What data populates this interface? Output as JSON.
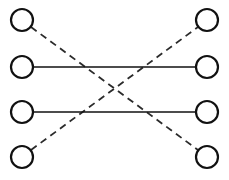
{
  "canvas": {
    "width": 229,
    "height": 180,
    "background_color": "#ffffff",
    "title": "Bipartite node diagram with solid and dashed connections"
  },
  "style": {
    "node_stroke_color": "#111111",
    "node_fill_color": "#ffffff",
    "node_stroke_width": 2.2,
    "node_radius": 11,
    "solid_edge_color": "#111111",
    "solid_edge_width": 1.6,
    "dashed_edge_color": "#2b2b2b",
    "dashed_edge_width": 1.8,
    "dash_pattern": "7 5"
  },
  "nodes": [
    {
      "id": "L1",
      "label": "",
      "side": "left",
      "row": 1,
      "cx": 22,
      "cy": 20,
      "r": 11
    },
    {
      "id": "L2",
      "label": "",
      "side": "left",
      "row": 2,
      "cx": 22,
      "cy": 67,
      "r": 11
    },
    {
      "id": "L3",
      "label": "",
      "side": "left",
      "row": 3,
      "cx": 22,
      "cy": 112,
      "r": 11
    },
    {
      "id": "L4",
      "label": "",
      "side": "left",
      "row": 4,
      "cx": 22,
      "cy": 157,
      "r": 11
    },
    {
      "id": "R1",
      "label": "",
      "side": "right",
      "row": 1,
      "cx": 207,
      "cy": 20,
      "r": 11
    },
    {
      "id": "R2",
      "label": "",
      "side": "right",
      "row": 2,
      "cx": 207,
      "cy": 67,
      "r": 11
    },
    {
      "id": "R3",
      "label": "",
      "side": "right",
      "row": 3,
      "cx": 207,
      "cy": 112,
      "r": 11
    },
    {
      "id": "R4",
      "label": "",
      "side": "right",
      "row": 4,
      "cx": 207,
      "cy": 157,
      "r": 11
    }
  ],
  "edges": [
    {
      "id": "E1",
      "from": "L2",
      "to": "R2",
      "style": "solid",
      "x1": 33,
      "y1": 67,
      "x2": 196,
      "y2": 67
    },
    {
      "id": "E2",
      "from": "L3",
      "to": "R3",
      "style": "solid",
      "x1": 33,
      "y1": 112,
      "x2": 196,
      "y2": 112
    },
    {
      "id": "E3",
      "from": "L1",
      "to": "R4",
      "style": "dashed",
      "x1": 31,
      "y1": 27,
      "x2": 198,
      "y2": 150
    },
    {
      "id": "E4",
      "from": "L4",
      "to": "R1",
      "style": "dashed",
      "x1": 31,
      "y1": 150,
      "x2": 198,
      "y2": 27
    }
  ],
  "crossing_point": {
    "x": 114,
    "y": 89
  },
  "legend": {
    "solid_meaning": "",
    "dashed_meaning": ""
  }
}
